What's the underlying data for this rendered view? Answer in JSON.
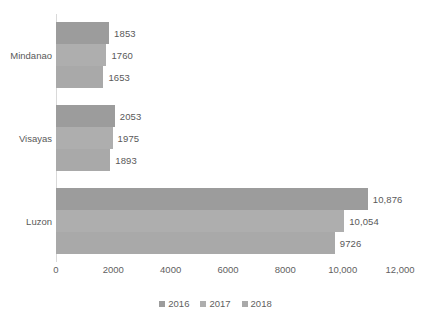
{
  "chart_data": {
    "type": "bar",
    "orientation": "horizontal",
    "title": "",
    "xlabel": "",
    "ylabel": "",
    "categories": [
      "Mindanao",
      "Visayas",
      "Luzon"
    ],
    "series": [
      {
        "name": "2016",
        "values": [
          1853,
          2053,
          10876
        ],
        "labels": [
          "1853",
          "2053",
          "10,876"
        ],
        "color": "#9c9c9c"
      },
      {
        "name": "2017",
        "values": [
          1760,
          1975,
          10054
        ],
        "labels": [
          "1760",
          "1975",
          "10,054"
        ],
        "color": "#aeaeae"
      },
      {
        "name": "2018",
        "values": [
          1653,
          1893,
          9726
        ],
        "labels": [
          "1653",
          "1893",
          "9726"
        ],
        "color": "#a9a9a9"
      }
    ],
    "xlim": [
      0,
      12000
    ],
    "xticks": [
      0,
      2000,
      4000,
      6000,
      8000,
      10000,
      12000
    ],
    "xtick_labels": [
      "0",
      "2000",
      "4000",
      "6000",
      "8000",
      "10,000",
      "12,000"
    ],
    "grid": false,
    "legend_position": "bottom",
    "legend_entries": [
      "2016",
      "2017",
      "2018"
    ]
  }
}
